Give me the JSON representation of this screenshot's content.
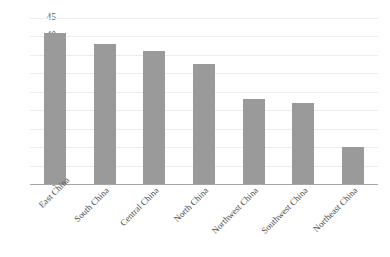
{
  "chart_data": {
    "type": "bar",
    "title": "",
    "xlabel": "",
    "ylabel": "",
    "ylim": [
      0,
      45
    ],
    "ytick_step": 5,
    "grid": true,
    "legend": "none",
    "orientation": "vertical",
    "bar_color": "#9a9a9a",
    "gridline_color": "#ededed",
    "axis_color": "#a6a6a6",
    "xtick_rotation": -45,
    "categories": [
      "East China",
      "South China",
      "Central China",
      "North China",
      "Northwest China",
      "Southwest China",
      "Northeast China"
    ],
    "values": [
      41,
      38,
      36,
      32.5,
      23,
      22,
      10
    ],
    "ytick_labels": [
      "45",
      "40",
      "35",
      "30",
      "25",
      "20",
      "15",
      "10",
      "5",
      "0"
    ],
    "ytick_values": [
      45,
      40,
      35,
      30,
      25,
      20,
      15,
      10,
      5,
      0
    ]
  }
}
